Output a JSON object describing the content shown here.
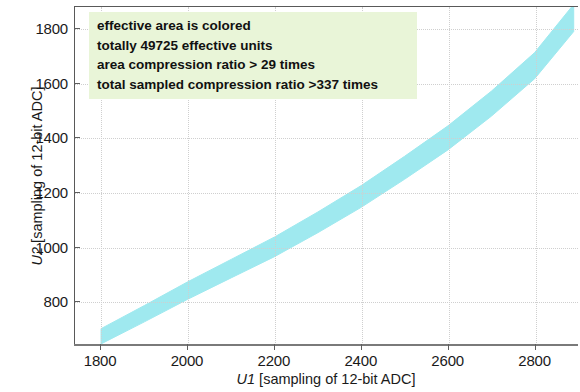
{
  "chart_data": {
    "type": "scatter",
    "title": "",
    "xlabel": "U1 [sampling of 12-bit ADC]",
    "ylabel": "U2 [sampling of 12-bit ADC]",
    "xlim": [
      1740,
      2900
    ],
    "ylim": [
      640,
      1880
    ],
    "xticks": [
      1800,
      2000,
      2200,
      2400,
      2600,
      2800
    ],
    "yticks": [
      800,
      1000,
      1200,
      1400,
      1600,
      1800
    ],
    "xticklabels": [
      "1800",
      "2000",
      "2200",
      "2400",
      "2600",
      "2800"
    ],
    "yticklabels": [
      "800",
      "1000",
      "1200",
      "1400",
      "1600",
      "1800"
    ],
    "grid": true,
    "grid_style": "dotted",
    "grid_color": "#cfcfcf",
    "legend": "none",
    "series": [
      {
        "name": "effective area",
        "type": "band",
        "color": "#9fe9ef",
        "description": "colored effective-area band rising from lower-left to upper-right",
        "center_points": [
          {
            "x": 1800,
            "y": 672
          },
          {
            "x": 1900,
            "y": 755
          },
          {
            "x": 2000,
            "y": 840
          },
          {
            "x": 2100,
            "y": 920
          },
          {
            "x": 2200,
            "y": 1000
          },
          {
            "x": 2300,
            "y": 1090
          },
          {
            "x": 2400,
            "y": 1185
          },
          {
            "x": 2500,
            "y": 1290
          },
          {
            "x": 2600,
            "y": 1400
          },
          {
            "x": 2700,
            "y": 1525
          },
          {
            "x": 2800,
            "y": 1665
          },
          {
            "x": 2890,
            "y": 1840
          }
        ],
        "band_half_width_y": [
          28,
          30,
          32,
          34,
          36,
          38,
          40,
          42,
          44,
          46,
          48,
          50
        ]
      }
    ]
  },
  "annotation": {
    "background_color": "#e9f5d8",
    "lines": [
      "effective area is colored",
      "totally 49725 effective units",
      "area compression ratio > 29 times",
      "total sampled compression ratio >337 times"
    ]
  },
  "axes": {
    "x_label_prefix": "U1",
    "x_label_rest": " [sampling of 12-bit ADC]",
    "y_label_prefix": "U2",
    "y_label_rest": " [sampling of 12-bit ADC]"
  }
}
